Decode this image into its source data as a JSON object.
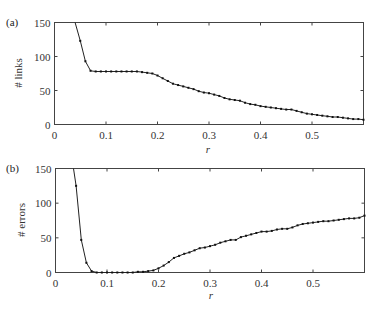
{
  "chart_data": [
    {
      "type": "line",
      "panel": "(a)",
      "title": "",
      "xlabel": "r",
      "ylabel": "# links",
      "xlim": [
        0,
        0.6
      ],
      "ylim": [
        0,
        150
      ],
      "xticks": [
        "0",
        "0.1",
        "0.2",
        "0.3",
        "0.4",
        "0.5"
      ],
      "yticks": [
        "0",
        "50",
        "100",
        "150"
      ],
      "grid": false,
      "legend": null,
      "series": [
        {
          "name": "# links",
          "x": [
            0.04,
            0.05,
            0.06,
            0.07,
            0.08,
            0.09,
            0.1,
            0.11,
            0.12,
            0.13,
            0.14,
            0.15,
            0.16,
            0.17,
            0.18,
            0.19,
            0.2,
            0.21,
            0.22,
            0.23,
            0.24,
            0.25,
            0.26,
            0.27,
            0.28,
            0.29,
            0.3,
            0.31,
            0.32,
            0.33,
            0.34,
            0.35,
            0.36,
            0.37,
            0.38,
            0.39,
            0.4,
            0.41,
            0.42,
            0.43,
            0.44,
            0.45,
            0.46,
            0.47,
            0.48,
            0.49,
            0.5,
            0.51,
            0.52,
            0.53,
            0.54,
            0.55,
            0.56,
            0.57,
            0.58,
            0.59,
            0.6
          ],
          "values": [
            150,
            123,
            93,
            79,
            78,
            78,
            78,
            78,
            78,
            78,
            78,
            78,
            78,
            77,
            76,
            75,
            72,
            68,
            64,
            60,
            58,
            56,
            54,
            52,
            49,
            47,
            46,
            44,
            42,
            39,
            37,
            36,
            35,
            32,
            30,
            29,
            27,
            26,
            25,
            24,
            23,
            22,
            22,
            20,
            18,
            16,
            15,
            14,
            13,
            12,
            11,
            11,
            10,
            9,
            8,
            8,
            7
          ]
        }
      ]
    },
    {
      "type": "line",
      "panel": "(b)",
      "title": "",
      "xlabel": "r",
      "ylabel": "# errors",
      "xlim": [
        0,
        0.6
      ],
      "ylim": [
        0,
        150
      ],
      "xticks": [
        "0",
        "0.1",
        "0.2",
        "0.3",
        "0.4",
        "0.5"
      ],
      "yticks": [
        "0",
        "50",
        "100",
        "150"
      ],
      "grid": false,
      "legend": null,
      "series": [
        {
          "name": "# errors",
          "x": [
            0.035,
            0.04,
            0.05,
            0.06,
            0.07,
            0.08,
            0.09,
            0.1,
            0.11,
            0.12,
            0.13,
            0.14,
            0.15,
            0.16,
            0.17,
            0.18,
            0.19,
            0.2,
            0.21,
            0.22,
            0.23,
            0.24,
            0.25,
            0.26,
            0.27,
            0.28,
            0.29,
            0.3,
            0.31,
            0.32,
            0.33,
            0.34,
            0.35,
            0.36,
            0.37,
            0.38,
            0.39,
            0.4,
            0.41,
            0.42,
            0.43,
            0.44,
            0.45,
            0.46,
            0.47,
            0.48,
            0.49,
            0.5,
            0.51,
            0.52,
            0.53,
            0.54,
            0.55,
            0.56,
            0.57,
            0.58,
            0.59,
            0.6
          ],
          "values": [
            150,
            125,
            47,
            14,
            2,
            0,
            0,
            0,
            0,
            0,
            0,
            0,
            0,
            1,
            1,
            2,
            3,
            6,
            10,
            15,
            21,
            24,
            27,
            29,
            32,
            35,
            36,
            38,
            40,
            43,
            45,
            47,
            47,
            51,
            53,
            55,
            57,
            59,
            59,
            60,
            62,
            63,
            63,
            65,
            68,
            70,
            71,
            72,
            73,
            74,
            74,
            75,
            76,
            77,
            78,
            78,
            79,
            82
          ]
        }
      ]
    }
  ]
}
